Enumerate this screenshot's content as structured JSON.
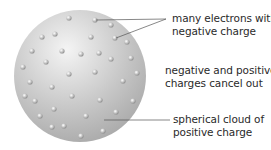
{
  "diagram": {
    "labels": {
      "electrons": [
        "many electrons with",
        "negative charge"
      ],
      "cancel": [
        "negative and positive",
        "charges cancel out"
      ],
      "cloud": [
        "spherical cloud of",
        "positive charge"
      ]
    },
    "sphere": {
      "cx": 80,
      "cy": 76,
      "r": 66,
      "color": "#c4c4c4"
    },
    "electrons": [
      [
        69,
        18
      ],
      [
        95,
        20
      ],
      [
        111,
        25
      ],
      [
        42,
        37
      ],
      [
        55,
        34
      ],
      [
        91,
        37
      ],
      [
        115,
        38
      ],
      [
        127,
        42
      ],
      [
        32,
        51
      ],
      [
        62,
        51
      ],
      [
        81,
        54
      ],
      [
        99,
        53
      ],
      [
        46,
        62
      ],
      [
        111,
        59
      ],
      [
        131,
        58
      ],
      [
        23,
        67
      ],
      [
        69,
        74
      ],
      [
        95,
        72
      ],
      [
        137,
        73
      ],
      [
        30,
        82
      ],
      [
        52,
        87
      ],
      [
        123,
        81
      ],
      [
        25,
        96
      ],
      [
        35,
        101
      ],
      [
        72,
        96
      ],
      [
        100,
        100
      ],
      [
        133,
        101
      ],
      [
        54,
        109
      ],
      [
        40,
        116
      ],
      [
        86,
        116
      ],
      [
        116,
        112
      ],
      [
        52,
        127
      ],
      [
        64,
        126
      ],
      [
        103,
        131
      ],
      [
        81,
        136
      ]
    ]
  }
}
